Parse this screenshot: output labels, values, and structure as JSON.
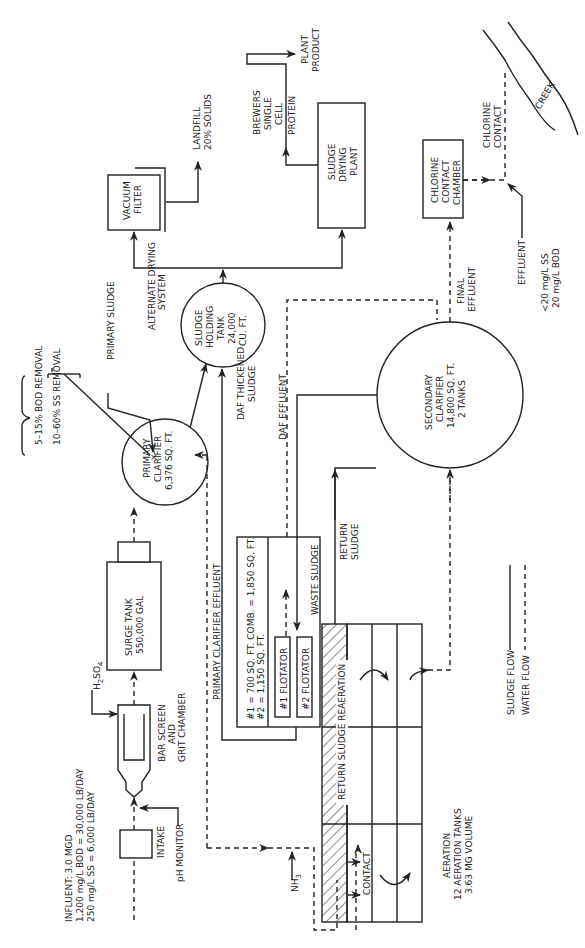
{
  "diagram": {
    "type": "process-flow",
    "orientation": "rotated-90-ccw",
    "colors": {
      "line": "#222222",
      "background": "#ffffff"
    },
    "influent": {
      "line1": "INFLUENT: 3.0 MGD",
      "line2": "1,200 mg/L BOD = 30,000 LB/DAY",
      "line3": "250 mg/L SS = 6,000 LB/DAY"
    },
    "intake": {
      "label": "INTAKE"
    },
    "ph_monitor": {
      "label": "pH MONITOR"
    },
    "bar_screen": {
      "line1": "BAR SCREEN",
      "line2": "AND",
      "line3": "GRIT CHAMBER"
    },
    "h2so4": {
      "label": "H",
      "sub": "2",
      "label2": "SO",
      "sub2": "4"
    },
    "surge_tank": {
      "line1": "SURGE TANK",
      "line2": "550,000 GAL"
    },
    "primary_clarifier": {
      "line1": "PRIMARY",
      "line2": "CLARIFIER",
      "line3": "6,376 SQ. FT."
    },
    "primary_clarifier_effluent": {
      "label": "PRIMARY CLARIFIER EFFLUENT"
    },
    "removal_notes": {
      "line1": "5–15% BOD REMOVAL",
      "line2": "10–60% SS REMOVAL"
    },
    "primary_sludge": {
      "label": "PRIMARY SLUDGE"
    },
    "sludge_holding_tank": {
      "line1": "SLUDGE",
      "line2": "HOLDING",
      "line3": "TANK",
      "line4": "24,000",
      "line5": "CU. FT."
    },
    "alternate_drying": {
      "line1": "ALTERNATE DRYING",
      "line2": "SYSTEM"
    },
    "vacuum_filter": {
      "line1": "VACUUM",
      "line2": "FILTER"
    },
    "landfill": {
      "line1": "LANDFILL",
      "line2": "20% SOLIDS"
    },
    "sludge_drying_plant": {
      "line1": "SLUDGE",
      "line2": "DRYING",
      "line3": "PLANT"
    },
    "brewers": {
      "line1": "BREWERS",
      "line2": "SINGLE",
      "line3": "CELL",
      "line4": "PROTEIN"
    },
    "plant_product": {
      "line1": "PLANT",
      "line2": "PRODUCT"
    },
    "daf_thickened": {
      "line1": "DAF THICKENED",
      "line2": "SLUDGE"
    },
    "daf_effluent": {
      "label": "DAF EFFLUENT"
    },
    "daf_unit": {
      "spec1": "#1 = 700 SQ. FT.  COMB. = 1,850 SQ. FT.",
      "spec2": "#2 = 1,150 SQ. FT.",
      "flotator1": "#1 FLOTATOR",
      "flotator2": "#2 FLOTATOR",
      "waste_sludge": "WASTE SLUDGE"
    },
    "return_sludge": {
      "line1": "RETURN",
      "line2": "SLUDGE"
    },
    "return_sludge_reaeration": {
      "label": "RETURN SLUDGE REAERATION"
    },
    "contact": {
      "label": "CONTACT"
    },
    "nh3": {
      "label": "NH",
      "sub": "3"
    },
    "aeration": {
      "line1": "AERATION",
      "line2": "12 AERATION TANKS",
      "line3": "3.63 MG VOLUME"
    },
    "secondary_clarifier": {
      "line1": "SECONDARY",
      "line2": "CLARIFIER",
      "line3": "14,800 SQ. FT.",
      "line4": "2 TANKS"
    },
    "final_effluent": {
      "line1": "FINAL",
      "line2": "EFFLUENT"
    },
    "chlorine_chamber": {
      "line1": "CHLORINE",
      "line2": "CONTACT",
      "line3": "CHAMBER"
    },
    "chlorine_contact": {
      "line1": "CHLORINE",
      "line2": "CONTACT"
    },
    "effluent": {
      "label": "EFFLUENT",
      "line1": "<20 mg/L SS",
      "line2": "20 mg/L BOD"
    },
    "creek": {
      "label": "CREEK"
    },
    "legend": {
      "sludge": "SLUDGE FLOW",
      "water": "WATER FLOW"
    }
  }
}
